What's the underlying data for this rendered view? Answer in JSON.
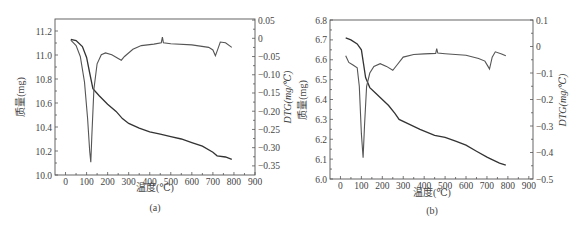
{
  "chart_data": [
    {
      "type": "line",
      "panel_label": "(a)",
      "xlabel": "温度(℃)",
      "ylabel": "质量(mg)",
      "y2label": "DTG(mg/℃)",
      "xlim": [
        -50,
        900
      ],
      "ylim": [
        10.0,
        11.3
      ],
      "y2lim": [
        -0.375,
        0.053
      ],
      "xticks": [
        0,
        100,
        200,
        300,
        400,
        500,
        600,
        700,
        800,
        900
      ],
      "yticks": [
        "10.0",
        "10.2",
        "10.4",
        "10.6",
        "10.8",
        "11.0",
        "11.2"
      ],
      "y2ticks": [
        "0.05",
        "0",
        "-0.05",
        "-0.10",
        "-0.15",
        "-0.20",
        "-0.25",
        "-0.30",
        "-0.35"
      ],
      "grid": false,
      "legend": null,
      "series": [
        {
          "name": "TG (质量)",
          "axis": "left",
          "x": [
            25,
            50,
            80,
            100,
            115,
            130,
            160,
            200,
            240,
            270,
            300,
            350,
            400,
            450,
            500,
            550,
            600,
            650,
            700,
            720,
            760,
            790
          ],
          "y": [
            11.13,
            11.12,
            11.07,
            10.98,
            10.85,
            10.72,
            10.66,
            10.59,
            10.53,
            10.47,
            10.43,
            10.39,
            10.36,
            10.34,
            10.32,
            10.3,
            10.27,
            10.24,
            10.19,
            10.16,
            10.15,
            10.13
          ]
        },
        {
          "name": "DTG",
          "axis": "right",
          "x": [
            25,
            50,
            70,
            90,
            105,
            115,
            120,
            125,
            135,
            150,
            170,
            190,
            220,
            250,
            265,
            280,
            320,
            360,
            420,
            455,
            460,
            465,
            500,
            600,
            680,
            700,
            712,
            720,
            735,
            760,
            790
          ],
          "y": [
            -0.005,
            -0.02,
            -0.05,
            -0.12,
            -0.22,
            -0.31,
            -0.34,
            -0.27,
            -0.14,
            -0.07,
            -0.045,
            -0.04,
            -0.045,
            -0.055,
            -0.06,
            -0.05,
            -0.03,
            -0.02,
            -0.016,
            -0.012,
            0.003,
            -0.012,
            -0.015,
            -0.018,
            -0.025,
            -0.032,
            -0.048,
            -0.035,
            -0.01,
            -0.012,
            -0.025
          ]
        }
      ]
    },
    {
      "type": "line",
      "panel_label": "(b)",
      "xlabel": "温度(℃)",
      "ylabel": "质量(mg)",
      "y2label": "DTG(mg/℃)",
      "xlim": [
        -50,
        920
      ],
      "ylim": [
        6.0,
        6.8
      ],
      "y2lim": [
        -0.5,
        0.1
      ],
      "xticks": [
        0,
        100,
        200,
        300,
        400,
        500,
        600,
        700,
        800,
        900
      ],
      "yticks": [
        "6.0",
        "6.1",
        "6.2",
        "6.3",
        "6.4",
        "6.5",
        "6.6",
        "6.7",
        "6.8"
      ],
      "y2ticks": [
        "0.1",
        "0",
        "-0.1",
        "-0.2",
        "-0.3",
        "-0.4",
        "-0.5"
      ],
      "grid": false,
      "legend": null,
      "series": [
        {
          "name": "TG (质量)",
          "axis": "left",
          "x": [
            25,
            50,
            80,
            100,
            110,
            120,
            140,
            170,
            200,
            230,
            260,
            280,
            320,
            380,
            450,
            500,
            550,
            600,
            650,
            700,
            720,
            760,
            790
          ],
          "y": [
            6.71,
            6.7,
            6.68,
            6.65,
            6.58,
            6.51,
            6.46,
            6.43,
            6.4,
            6.37,
            6.33,
            6.3,
            6.28,
            6.25,
            6.22,
            6.21,
            6.19,
            6.17,
            6.14,
            6.11,
            6.1,
            6.08,
            6.07
          ]
        },
        {
          "name": "DTG",
          "axis": "right",
          "x": [
            25,
            40,
            60,
            80,
            90,
            100,
            108,
            115,
            125,
            140,
            160,
            190,
            220,
            250,
            270,
            300,
            350,
            400,
            455,
            460,
            465,
            500,
            600,
            660,
            690,
            705,
            712,
            725,
            740,
            770,
            790
          ],
          "y": [
            -0.035,
            -0.06,
            -0.07,
            -0.08,
            -0.15,
            -0.33,
            -0.42,
            -0.3,
            -0.15,
            -0.1,
            -0.075,
            -0.065,
            -0.075,
            -0.09,
            -0.07,
            -0.04,
            -0.03,
            -0.028,
            -0.026,
            -0.008,
            -0.025,
            -0.027,
            -0.033,
            -0.045,
            -0.055,
            -0.075,
            -0.085,
            -0.04,
            -0.02,
            -0.028,
            -0.035
          ]
        }
      ]
    }
  ],
  "panels": [
    {
      "label": "(a)",
      "xlabel": "温度(℃)",
      "ylabel": "质量(mg)",
      "y2label": "DTG(mg/℃)"
    },
    {
      "label": "(b)",
      "xlabel": "温度(℃)",
      "ylabel": "质量(mg)",
      "y2label": "DTG(mg/℃)"
    }
  ]
}
